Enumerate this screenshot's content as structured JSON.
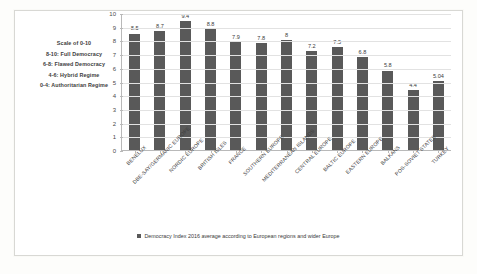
{
  "scale_note": {
    "lines": [
      "Scale of 0-10",
      "8-10: Full Democracy",
      "6-8: Flawed Democracy",
      "4-6: Hybrid Regime",
      "0-4: Authoritarian Regime"
    ]
  },
  "legend": {
    "series_label": "Democracy Index 2016 average according to European regions and wider Europe",
    "swatch_color": "#595959"
  },
  "chart_data": {
    "type": "bar",
    "title": "",
    "xlabel": "",
    "ylabel": "",
    "ylim": [
      0,
      10
    ],
    "ytick_labels": [
      "0",
      "1",
      "2",
      "3",
      "4",
      "5",
      "6",
      "7",
      "8",
      "9",
      "10"
    ],
    "grid": true,
    "legend_position": "bottom",
    "bar_color": "#595959",
    "categories": [
      "BENELUX",
      "DBE-SAY/GERMANIC EUROPE",
      "NORDIC EUROPE",
      "BRITISH ISLES",
      "FRANCE",
      "SOUTHERN EUROPE",
      "MEDITERRANEAN ISLANDS",
      "CENTRAL EUROPE",
      "BALTIC EUROPE",
      "EASTERN EUROPE",
      "BALKANS",
      "POS-SOVIET STATES",
      "TURKEY"
    ],
    "values": [
      8.5,
      8.7,
      9.4,
      8.8,
      7.9,
      7.8,
      8,
      7.2,
      7.5,
      6.8,
      5.8,
      4.4,
      5.04
    ],
    "value_labels": [
      "8.5",
      "8.7",
      "9.4",
      "8.8",
      "7.9",
      "7.8",
      "8",
      "7.2",
      "7.5",
      "6.8",
      "5.8",
      "4.4",
      "5.04"
    ],
    "series": [
      {
        "name": "Democracy Index 2016 average according to European regions and wider Europe",
        "values": [
          8.5,
          8.7,
          9.4,
          8.8,
          7.9,
          7.8,
          8,
          7.2,
          7.5,
          6.8,
          5.8,
          4.4,
          5.04
        ]
      }
    ]
  }
}
